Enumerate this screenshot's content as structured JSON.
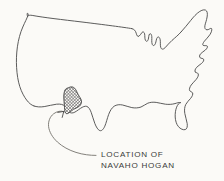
{
  "figure": {
    "title": "Location of Navaho Hogan",
    "background_color": "#fbfaf7",
    "ink_color": "#4a4a4a",
    "leader_color": "#6d6a64",
    "width": 224,
    "height": 181
  },
  "map": {
    "name": "united-states-outline",
    "style": "hand-drawn contour sketch",
    "description": "Outline map of the contiguous United States"
  },
  "highlight": {
    "name": "navaho-hogan-region",
    "pattern": "cross-hatch",
    "region": "Four Corners / northeastern Arizona",
    "pattern_color": "#4a4a4a"
  },
  "annotation": {
    "arrow_name": "curved-leader-arrow",
    "caption_line_1": "LOCATION OF",
    "caption_line_2": "NAVAHO HOGAN",
    "caption_x": 101,
    "caption_line_1_y": 157,
    "caption_line_2_y": 168
  }
}
